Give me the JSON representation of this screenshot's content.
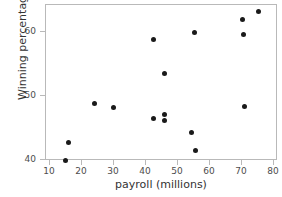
{
  "chart_data": {
    "type": "scatter",
    "title": "",
    "xlabel": "payroll (millions)",
    "ylabel": "Winning percentage",
    "xlim": [
      8,
      81
    ],
    "ylim": [
      38.5,
      63.5
    ],
    "grid": false,
    "legend": "none",
    "xticks": [
      10,
      20,
      30,
      40,
      50,
      60,
      70,
      80
    ],
    "xtick_labels": [
      "10",
      "20",
      "30",
      "40",
      "50",
      "60",
      "70",
      "80"
    ],
    "yticks": [
      40,
      50,
      60
    ],
    "ytick_labels": [
      "40",
      "50",
      "60"
    ],
    "marker": "filled-circle",
    "marker_color": "#1a1a1a",
    "points": [
      {
        "x": 15.2,
        "y": 39.7
      },
      {
        "x": 16.2,
        "y": 42.6
      },
      {
        "x": 24.2,
        "y": 48.6
      },
      {
        "x": 30.2,
        "y": 48.0
      },
      {
        "x": 42.6,
        "y": 58.6
      },
      {
        "x": 42.6,
        "y": 46.4
      },
      {
        "x": 46.0,
        "y": 53.3
      },
      {
        "x": 46.0,
        "y": 46.9
      },
      {
        "x": 46.0,
        "y": 46.0
      },
      {
        "x": 54.5,
        "y": 44.2
      },
      {
        "x": 55.5,
        "y": 59.8
      },
      {
        "x": 55.8,
        "y": 41.4
      },
      {
        "x": 70.6,
        "y": 61.8
      },
      {
        "x": 70.9,
        "y": 59.5
      },
      {
        "x": 71.0,
        "y": 48.2
      },
      {
        "x": 75.4,
        "y": 63.0
      }
    ]
  },
  "axis": {
    "x_axis_name": "payroll-axis",
    "y_axis_name": "winning-percentage-axis"
  }
}
